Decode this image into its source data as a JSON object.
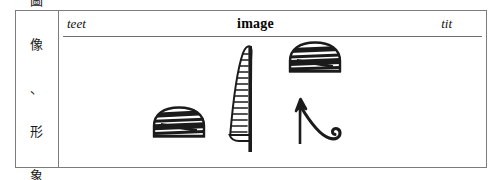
{
  "figure": {
    "label_cell": {
      "vertical_text": "圖像、形象",
      "characters": [
        "圖",
        "像",
        "、",
        "形",
        "象"
      ]
    },
    "header": {
      "left": "teet",
      "center": "image",
      "right": "tit"
    },
    "glyphs": [
      {
        "name": "loaf-sign-lower",
        "transliteration": "t",
        "description": "striped dome loaf sign"
      },
      {
        "name": "reed-sign",
        "transliteration": "i",
        "description": "tall ladder-ruled reed leaf"
      },
      {
        "name": "loaf-sign-upper",
        "transliteration": "t",
        "description": "striped dome loaf sign"
      },
      {
        "name": "tyet-sign",
        "transliteration": "tit",
        "description": "vertical stroke with spiral curl"
      }
    ],
    "colors": {
      "border": "#7c7c7c",
      "rule": "#6f6f6f",
      "ink": "#1a1a1a",
      "background": "#ffffff"
    }
  }
}
